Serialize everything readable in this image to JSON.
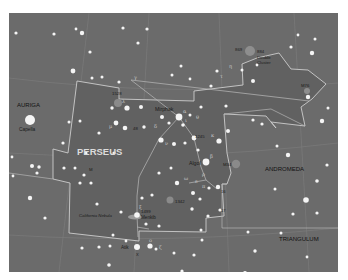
{
  "map": {
    "title": "Perseus star chart",
    "colors": {
      "sky": "#6b6b6b",
      "constellation_fill": "#5f5f5f",
      "boundary": "#c9c9c9",
      "grid": "#7c7c7c",
      "star": "#f4f4f4",
      "nebula": "#8a8a8a",
      "label": "#1a1a1a",
      "main_label": "#dcdcdc"
    },
    "constellations": {
      "main": "PERSEUS",
      "auriga": "AURIGA",
      "andromeda": "ANDROMEDA",
      "triangulum": "TRIANGULUM"
    },
    "stars": {
      "capella": "Capella",
      "mirphak": "Mirphak",
      "algol": "Algol",
      "menkib": "Menkib",
      "atik": "Atik"
    },
    "objects": {
      "ngc869": "869",
      "ngc884": "884",
      "double_cluster_1": "Double",
      "double_cluster_2": "Cluster",
      "m76": "M76",
      "ngc1528": "1528",
      "m34": "M34",
      "ngc1245": "1245",
      "ngc1342": "1342",
      "ngc1499": "1499",
      "california_nebula": "California Nebula",
      "m_near_perseus": "M",
      "star_48": "48",
      "star_16": "16",
      "star_17": "17",
      "star_X": "X"
    },
    "greek": {
      "gamma": "γ",
      "delta": "δ",
      "alpha": "α",
      "beta": "β",
      "rho": "ρ",
      "omicron": "ο",
      "zeta": "ζ",
      "xi": "ξ",
      "epsilon": "ε",
      "mu": "μ",
      "lambda": "λ",
      "nu": "ν",
      "kappa": "κ",
      "iota": "ι",
      "theta": "θ",
      "tau": "τ",
      "eta": "η",
      "pi": "π",
      "omega": "ω"
    }
  }
}
